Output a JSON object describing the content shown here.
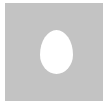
{
  "figure": {
    "colors": {
      "background": "#ffffff",
      "square": "#c3c3c3",
      "oval": "#ffffff"
    },
    "shapes": [
      {
        "name": "square",
        "kind": "rectangle"
      },
      {
        "name": "oval",
        "kind": "ellipse"
      }
    ]
  }
}
